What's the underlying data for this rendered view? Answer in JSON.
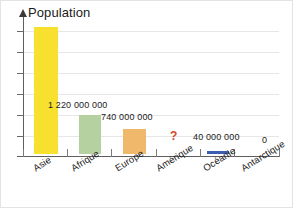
{
  "chart_data": {
    "type": "bar",
    "title": "",
    "ylabel": "Population",
    "xlabel": "",
    "grid": true,
    "legend": "none",
    "axis_arrow": true,
    "ylim": [
      0,
      4500000000
    ],
    "gridline_count": 6,
    "categories": [
      "Asie",
      "Afrique",
      "Europe",
      "Amérique",
      "Océanie",
      "Antarctique"
    ],
    "values": [
      4000000000,
      1220000000,
      740000000,
      null,
      40000000,
      0
    ],
    "value_labels": [
      "",
      "1 220 000 000",
      "740 000 000",
      "?",
      "40 000 000",
      "0"
    ],
    "bar_colors": [
      "#f7e02e",
      "#b6d1a0",
      "#efb86a",
      "none",
      "#3a5fb0",
      "none"
    ],
    "unknown_marker": "?",
    "unknown_marker_color": "#d4462a"
  },
  "bars": [
    {
      "name": "asie",
      "label": "Asie",
      "value_label": "",
      "color": "#f7e02e",
      "left": 33,
      "width": 24,
      "height": 127
    },
    {
      "name": "afrique",
      "label": "Afrique",
      "value_label": "1 220 000 000",
      "color": "#b6d1a0",
      "left": 78,
      "width": 22,
      "height": 39
    },
    {
      "name": "europe",
      "label": "Europe",
      "value_label": "740 000 000",
      "color": "#efb86a",
      "left": 122,
      "width": 23,
      "height": 25
    },
    {
      "name": "amerique",
      "label": "Amérique",
      "value_label": "?",
      "color": "transparent",
      "left": 167,
      "width": 22,
      "height": 0
    },
    {
      "name": "oceanie",
      "label": "Océanie",
      "value_label": "40 000 000",
      "color": "#3a5fb0",
      "left": 206,
      "width": 22,
      "height": 3
    },
    {
      "name": "antarctique",
      "label": "Antarctique",
      "value_label": "0",
      "color": "transparent",
      "left": 250,
      "width": 22,
      "height": 0
    }
  ],
  "value_label_positions": [
    {
      "name": "label-afrique",
      "text": "1 220 000 000",
      "left": 47,
      "top": 99,
      "unknown": false
    },
    {
      "name": "label-europe",
      "text": "740 000 000",
      "left": 100,
      "top": 111,
      "unknown": false
    },
    {
      "name": "label-amerique",
      "text": "?",
      "left": 169,
      "top": 128,
      "unknown": true
    },
    {
      "name": "label-oceanie",
      "text": "40 000 000",
      "left": 192,
      "top": 131,
      "unknown": false
    },
    {
      "name": "label-antarctique",
      "text": "0",
      "left": 261,
      "top": 134,
      "unknown": false
    }
  ],
  "category_label_positions": [
    {
      "name": "cat-asie",
      "text": "Asie",
      "left": 30,
      "top": 163
    },
    {
      "name": "cat-afrique",
      "text": "Afrique",
      "left": 68,
      "top": 163
    },
    {
      "name": "cat-europe",
      "text": "Europe",
      "left": 112,
      "top": 163
    },
    {
      "name": "cat-amerique",
      "text": "Amérique",
      "left": 153,
      "top": 163
    },
    {
      "name": "cat-oceanie",
      "text": "Océanie",
      "left": 200,
      "top": 163
    },
    {
      "name": "cat-antarctique",
      "text": "Antarctique",
      "left": 238,
      "top": 163
    }
  ],
  "gridlines": [
    30,
    51,
    72,
    93,
    114,
    135
  ],
  "yticks": [
    30,
    51,
    72,
    93,
    114,
    135,
    155
  ],
  "xticks": [
    22,
    66,
    110,
    155,
    199,
    233,
    278
  ]
}
